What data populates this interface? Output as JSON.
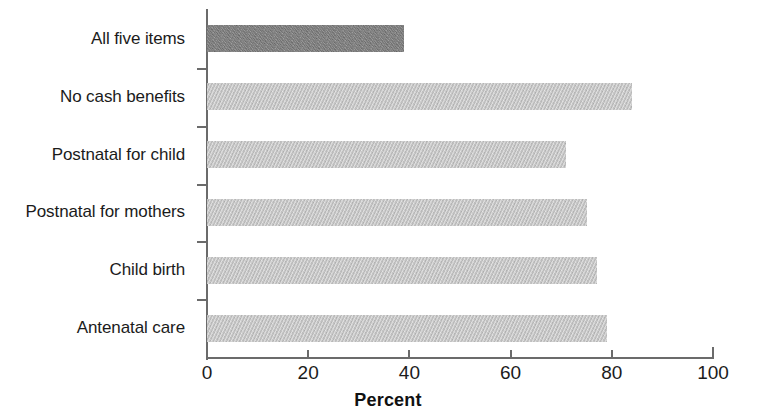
{
  "chart_data": {
    "type": "bar",
    "orientation": "horizontal",
    "title": "",
    "subtitle": "",
    "xlabel": "Percent",
    "ylabel": "",
    "categories": [
      "All five items",
      "No cash benefits",
      "Postnatal for child",
      "Postnatal for mothers",
      "Child birth",
      "Antenatal care"
    ],
    "values": [
      39,
      84,
      71,
      75,
      77,
      79
    ],
    "xlim": [
      0,
      100
    ],
    "xticks": [
      0,
      20,
      40,
      60,
      80,
      100
    ],
    "xtick_labels": [
      "0",
      "20",
      "40",
      "60",
      "80",
      "100"
    ],
    "grid": false,
    "legend": null,
    "bar_colors": [
      "#7b7b7b",
      "#c3c3c3",
      "#c3c3c3",
      "#c3c3c3",
      "#c3c3c3",
      "#c3c3c3"
    ],
    "axis_color": "#6b6b6b",
    "text_color": "#1b1b1b",
    "background": "#ffffff"
  }
}
